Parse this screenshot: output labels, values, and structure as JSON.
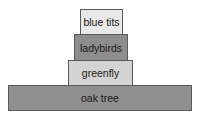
{
  "diagram": {
    "type": "pyramid",
    "levels": [
      {
        "label": "blue tits",
        "fill": "#e8e8e8"
      },
      {
        "label": "ladybirds",
        "fill": "#8d8d8d"
      },
      {
        "label": "greenfly",
        "fill": "#d3d3d3"
      },
      {
        "label": "oak tree",
        "fill": "#8f8f8f"
      }
    ]
  }
}
